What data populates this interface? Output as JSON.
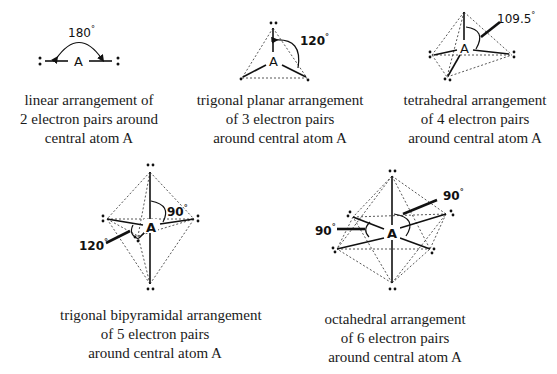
{
  "diagrams": [
    {
      "id": "linear",
      "atom_label": "A",
      "angle_label": "180",
      "degree_symbol": "°",
      "electron_pairs": 2,
      "caption": [
        "linear arrangement of",
        "2 electron pairs around",
        "central atom A"
      ]
    },
    {
      "id": "trigonal-planar",
      "atom_label": "A",
      "angle_label": "120",
      "degree_symbol": "°",
      "electron_pairs": 3,
      "caption": [
        "trigonal planar arrangement",
        "of 3 electron pairs",
        "around central atom A"
      ]
    },
    {
      "id": "tetrahedral",
      "atom_label": "A",
      "angle_label": "109.5",
      "degree_symbol": "°",
      "electron_pairs": 4,
      "caption": [
        "tetrahedral arrangement",
        "of 4 electron pairs",
        "around central atom A"
      ]
    },
    {
      "id": "trigonal-bipyramidal",
      "atom_label": "A",
      "angle_labels": [
        "90",
        "120"
      ],
      "degree_symbol": "°",
      "electron_pairs": 5,
      "caption": [
        "trigonal bipyramidal arrangement",
        "of 5 electron pairs",
        "around central atom A"
      ]
    },
    {
      "id": "octahedral",
      "atom_label": "A",
      "angle_labels": [
        "90",
        "90"
      ],
      "degree_symbol": "°",
      "electron_pairs": 6,
      "caption": [
        "octahedral arrangement",
        "of 6 electron pairs",
        "around central atom A"
      ]
    }
  ]
}
